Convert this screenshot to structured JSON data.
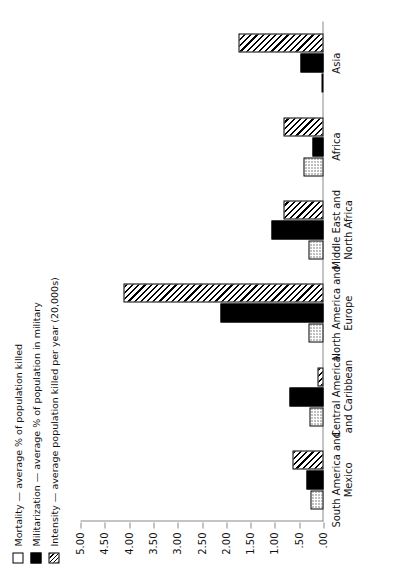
{
  "chart_data": {
    "type": "bar",
    "title": "",
    "xlabel": "",
    "ylabel": "",
    "ylim": [
      0,
      5
    ],
    "grid": false,
    "legend_position": "top-left",
    "orientation": "vertical-rendered-rotated",
    "categories": [
      "South America and\nMexico",
      "Central America\nand Caribbean",
      "North America and\nEurope",
      "Middle East and\nNorth Africa",
      "Africa",
      "Asia"
    ],
    "tick_labels": [
      "5.00",
      "4.50",
      "4.00",
      "3.50",
      "3.00",
      "2.50",
      "2.00",
      "1.50",
      "1.00",
      ".50",
      ".00"
    ],
    "tick_values": [
      5.0,
      4.5,
      4.0,
      3.5,
      3.0,
      2.5,
      2.0,
      1.5,
      1.0,
      0.5,
      0.0
    ],
    "series": [
      {
        "name": "Mortality",
        "legend_label": "Mortality — average % of population killed",
        "pattern": "dotted",
        "values": [
          0.27,
          0.28,
          0.3,
          0.3,
          0.42,
          0.05
        ]
      },
      {
        "name": "Militarization",
        "legend_label": "Militarization — average % of population in military",
        "pattern": "solid-black",
        "values": [
          0.34,
          0.7,
          2.12,
          1.08,
          0.23,
          0.48
        ]
      },
      {
        "name": "Intensity",
        "legend_label": "Intensity — average population killed per year (20,000s)",
        "pattern": "diagonal-hatch",
        "values": [
          0.64,
          0.13,
          4.11,
          0.82,
          0.82,
          1.74
        ]
      }
    ]
  },
  "legend": {
    "items": [
      {
        "label": "Mortality — average % of population killed",
        "swatch": "dotted-square-icon"
      },
      {
        "label": "Militarization — average % of population in military",
        "swatch": "black-square-icon"
      },
      {
        "label": "Intensity — average population killed per year (20,000s)",
        "swatch": "hatched-square-icon"
      }
    ]
  }
}
